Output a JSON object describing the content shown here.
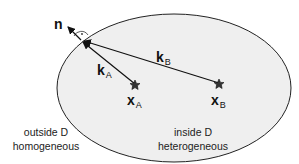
{
  "diagram": {
    "normal_label": "n",
    "vectors": [
      {
        "symbol": "k",
        "subscript": "A"
      },
      {
        "symbol": "k",
        "subscript": "B"
      }
    ],
    "points": [
      {
        "symbol": "x",
        "subscript": "A"
      },
      {
        "symbol": "x",
        "subscript": "B"
      }
    ],
    "regions": {
      "outside": {
        "line1": "outside D",
        "line2": "homogeneous"
      },
      "inside": {
        "line1": "inside D",
        "line2": "heterogeneous"
      }
    },
    "colors": {
      "fill": "#efefef",
      "stroke": "#222222"
    }
  }
}
